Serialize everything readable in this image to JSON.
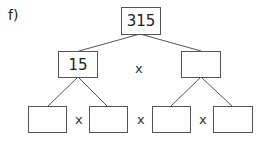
{
  "problem_label": "f)",
  "operator": "x",
  "tree": {
    "root": {
      "value": "315"
    },
    "level1": [
      {
        "value": "15"
      },
      {
        "value": ""
      }
    ],
    "level2": [
      {
        "value": ""
      },
      {
        "value": ""
      },
      {
        "value": ""
      },
      {
        "value": ""
      }
    ]
  },
  "colors": {
    "line": "#555555",
    "text": "#222222",
    "background": "#ffffff"
  }
}
